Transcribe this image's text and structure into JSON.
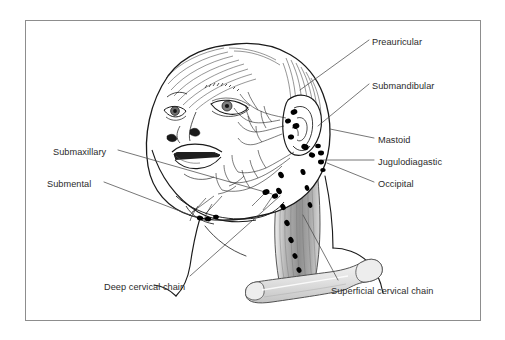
{
  "figure": {
    "type": "anatomical-diagram",
    "frame": {
      "border_color": "#8d8d8d",
      "background_color": "#ffffff"
    },
    "palette": {
      "outline": "#1a1a1a",
      "node_fill": "#000000",
      "muscle_fill": "#9a9a9a",
      "bone_fill": "#e2e2e2",
      "leader_line": "#4a4a4a",
      "text": "#2b2b2b",
      "shading": "#c9c9c9"
    }
  },
  "labels": [
    {
      "id": "preauricular",
      "text": "Preauricular",
      "x": 372,
      "y": 37,
      "align": "left"
    },
    {
      "id": "submandibular",
      "text": "Submandibular",
      "x": 372,
      "y": 81,
      "align": "left"
    },
    {
      "id": "mastoid",
      "text": "Mastoid",
      "x": 378,
      "y": 135,
      "align": "left"
    },
    {
      "id": "jugulodiagastic",
      "text": "Jugulodiagastic",
      "x": 378,
      "y": 157,
      "align": "left"
    },
    {
      "id": "occipital",
      "text": "Occipital",
      "x": 378,
      "y": 179,
      "align": "left"
    },
    {
      "id": "submaxillary",
      "text": "Submaxillary",
      "x": 53,
      "y": 147,
      "align": "left"
    },
    {
      "id": "submental",
      "text": "Submental",
      "x": 47,
      "y": 179,
      "align": "left"
    },
    {
      "id": "deep-cervical-chain",
      "text": "Deep cervical chain",
      "x": 104,
      "y": 282,
      "align": "left"
    },
    {
      "id": "superficial-cervical-chain",
      "text": "Superficial cervical chain",
      "x": 331,
      "y": 286,
      "align": "left"
    }
  ],
  "leader_lines": [
    {
      "id": "preauricular-leader",
      "points": "369,40 300,90"
    },
    {
      "id": "submandibular-leader",
      "points": "369,84 318,126"
    },
    {
      "id": "mastoid-leader",
      "points": "374,138 330,129"
    },
    {
      "id": "jugulodiagastic-leader",
      "points": "374,160 323,160"
    },
    {
      "id": "occipital-leader",
      "points": "374,182 327,163"
    },
    {
      "id": "submaxillary-leader",
      "points": "118,150 272,194"
    },
    {
      "id": "submental-leader",
      "points": "104,182 206,221"
    },
    {
      "id": "deep-cervical-chain-leader",
      "points": "190,276 280,196"
    },
    {
      "id": "superficial-cervical-chain-leader",
      "points": "338,280 303,215"
    }
  ],
  "lymph_node_groups": [
    {
      "id": "preauricular-nodes",
      "label": "Preauricular",
      "nodes": [
        {
          "cx": 296,
          "cy": 125,
          "r": 3.3
        },
        {
          "cx": 291,
          "cy": 136,
          "r": 3.0
        }
      ]
    },
    {
      "id": "submandibular-nodes",
      "label": "Submandibular",
      "nodes": [
        {
          "cx": 304,
          "cy": 147,
          "r": 3.6
        },
        {
          "cx": 311,
          "cy": 154,
          "r": 3.0
        }
      ]
    },
    {
      "id": "mastoid-nodes",
      "label": "Mastoid",
      "nodes": [
        {
          "cx": 294,
          "cy": 112,
          "r": 3.2
        },
        {
          "cx": 288,
          "cy": 121,
          "r": 2.8
        }
      ]
    },
    {
      "id": "jugulodiagastic-nodes",
      "label": "Jugulodiagastic",
      "nodes": [
        {
          "cx": 321,
          "cy": 153,
          "r": 3.0
        },
        {
          "cx": 321,
          "cy": 162,
          "r": 3.0
        },
        {
          "cx": 323,
          "cy": 170,
          "r": 2.6
        }
      ]
    },
    {
      "id": "occipital-nodes",
      "label": "Occipital",
      "nodes": [
        {
          "cx": 318,
          "cy": 146,
          "r": 2.6
        }
      ]
    },
    {
      "id": "submaxillary-nodes",
      "label": "Submaxillary",
      "nodes": [
        {
          "cx": 266,
          "cy": 192,
          "r": 3.4
        },
        {
          "cx": 274,
          "cy": 196,
          "r": 3.0
        }
      ]
    },
    {
      "id": "submental-nodes",
      "label": "Submental",
      "nodes": [
        {
          "cx": 200,
          "cy": 218,
          "r": 3.0
        },
        {
          "cx": 208,
          "cy": 219,
          "r": 3.0
        },
        {
          "cx": 216,
          "cy": 217,
          "r": 2.8
        }
      ]
    },
    {
      "id": "deep-cervical-chain-nodes",
      "label": "Deep cervical chain",
      "nodes": [
        {
          "cx": 281,
          "cy": 175,
          "r": 3.2
        },
        {
          "cx": 279,
          "cy": 191,
          "r": 3.2
        },
        {
          "cx": 283,
          "cy": 207,
          "r": 3.0
        },
        {
          "cx": 287,
          "cy": 223,
          "r": 3.0
        },
        {
          "cx": 291,
          "cy": 240,
          "r": 3.0
        },
        {
          "cx": 295,
          "cy": 256,
          "r": 2.8
        },
        {
          "cx": 299,
          "cy": 270,
          "r": 2.8
        }
      ]
    },
    {
      "id": "superficial-cervical-chain-nodes",
      "label": "Superficial cervical chain",
      "nodes": [
        {
          "cx": 303,
          "cy": 172,
          "r": 3.0
        },
        {
          "cx": 307,
          "cy": 188,
          "r": 2.8
        },
        {
          "cx": 310,
          "cy": 205,
          "r": 2.8
        }
      ]
    }
  ],
  "anatomy_parts": [
    {
      "id": "skull-cranium",
      "name": "infant head outline"
    },
    {
      "id": "ear-auricle",
      "name": "ear / auricle"
    },
    {
      "id": "eye-near",
      "name": "near eye"
    },
    {
      "id": "eye-far",
      "name": "far eye"
    },
    {
      "id": "nose",
      "name": "nose"
    },
    {
      "id": "open-mouth",
      "name": "open mouth"
    },
    {
      "id": "eyebrow",
      "name": "eyebrow"
    },
    {
      "id": "hair-strokes",
      "name": "hair"
    },
    {
      "id": "sternocleidomastoid",
      "name": "sternocleidomastoid muscle"
    },
    {
      "id": "clavicle",
      "name": "clavicle bone"
    },
    {
      "id": "shoulder",
      "name": "shoulder contour"
    },
    {
      "id": "lymphatic-vessels",
      "name": "lymphatic vessel network"
    }
  ]
}
